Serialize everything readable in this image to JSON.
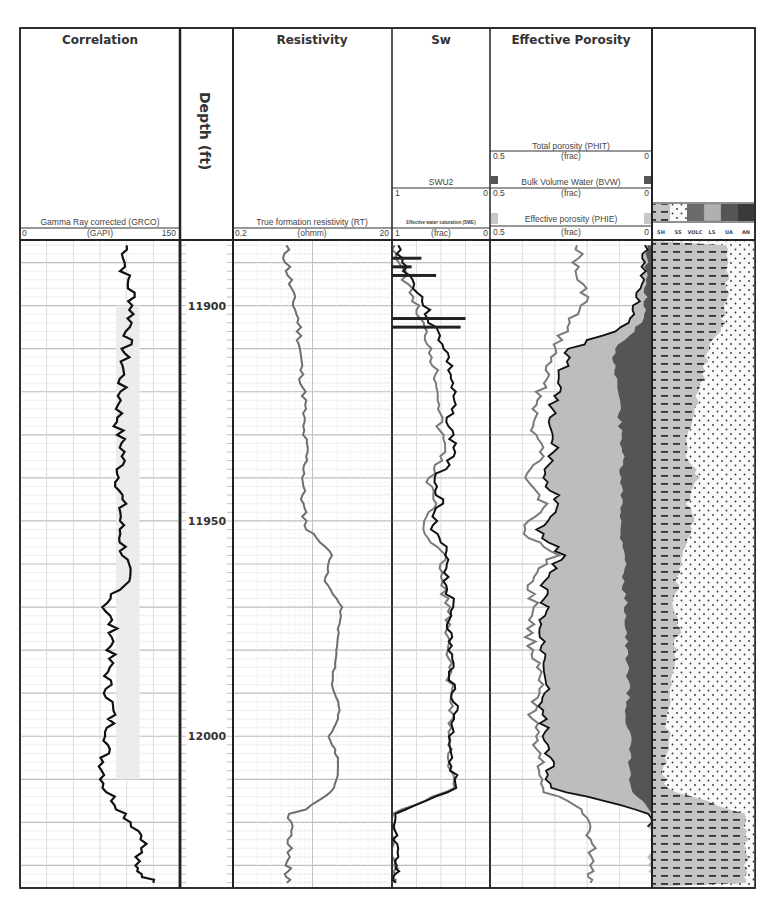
{
  "tracks": {
    "correlation": {
      "title": "Correlation",
      "curve": {
        "name": "Gamma Ray corrected (GRCO)",
        "unit": "(GAPI)",
        "min": "0",
        "max": "150"
      }
    },
    "depth": {
      "title": "Depth (ft)",
      "labels": [
        "11900",
        "11950",
        "12000"
      ]
    },
    "resistivity": {
      "title": "Resistivity",
      "curve": {
        "name": "True formation resistivity (RT)",
        "unit": "(ohmm)",
        "min": "0.2",
        "max": "20"
      }
    },
    "sw": {
      "title": "Sw",
      "curves": [
        {
          "name": "SWU2",
          "unit": "",
          "min": "1",
          "max": "0"
        },
        {
          "name": "Effective water saturation (SWE)",
          "unit": "(frac)",
          "min": "1",
          "max": "0"
        }
      ]
    },
    "porosity": {
      "title": "Effective Porosity",
      "curves": [
        {
          "name": "Total porosity (PHIT)",
          "unit": "(frac)",
          "min": "0.5",
          "max": "0"
        },
        {
          "name": "Bulk Volume Water (BVW)",
          "unit": "(frac)",
          "min": "0.5",
          "max": "0"
        },
        {
          "name": "Effective porosity (PHIE)",
          "unit": "(frac)",
          "min": "0.5",
          "max": "0"
        }
      ]
    },
    "lithology": {
      "legend": [
        "SH",
        "SS",
        "VOLC",
        "LS",
        "UA",
        "AN"
      ]
    }
  },
  "colors": {
    "grid": "#c8c8c8",
    "gr": "#111111",
    "rt": "#6e6e6e",
    "phie_fill": "#bdbdbd",
    "bvw_fill": "#555555",
    "shale": "#c4c4c4",
    "gr_fill": "#ececec"
  },
  "chart_data": {
    "type": "line",
    "ylabel": "Depth (ft)",
    "ylim": [
      11885,
      12035
    ],
    "depth_ticks": [
      11900,
      11950,
      12000
    ],
    "depth": [
      11886,
      11892,
      11898,
      11904,
      11910,
      11916,
      11922,
      11928,
      11934,
      11940,
      11946,
      11952,
      11958,
      11964,
      11970,
      11976,
      11982,
      11988,
      11994,
      12000,
      12006,
      12012,
      12018,
      12024,
      12030,
      12034
    ],
    "series": [
      {
        "name": "GRCO",
        "unit": "GAPI",
        "xlim": [
          0,
          150
        ],
        "values": [
          100,
          98,
          106,
          104,
          99,
          96,
          94,
          92,
          97,
          93,
          95,
          94,
          98,
          100,
          80,
          88,
          84,
          82,
          86,
          84,
          78,
          80,
          98,
          118,
          106,
          125
        ]
      },
      {
        "name": "RT",
        "unit": "ohmm",
        "xlim": [
          0.2,
          20
        ],
        "scale": "log",
        "values": [
          0.9,
          1.0,
          1.1,
          1.35,
          1.4,
          1.45,
          1.6,
          1.5,
          1.7,
          1.55,
          1.5,
          1.7,
          3.5,
          2.8,
          4.6,
          4.2,
          3.9,
          3.5,
          4.5,
          3.2,
          4.3,
          3.8,
          1.1,
          1.0,
          1.0,
          0.95
        ]
      },
      {
        "name": "SWE",
        "unit": "frac",
        "xlim": [
          1,
          0
        ],
        "values": [
          0.95,
          0.85,
          0.7,
          0.6,
          0.45,
          0.4,
          0.38,
          0.42,
          0.35,
          0.55,
          0.5,
          0.6,
          0.42,
          0.45,
          0.38,
          0.42,
          0.4,
          0.38,
          0.35,
          0.4,
          0.38,
          0.36,
          1.0,
          0.98,
          0.97,
          0.96
        ]
      },
      {
        "name": "SWU2",
        "unit": "frac",
        "xlim": [
          1,
          0
        ],
        "values": [
          0.98,
          0.9,
          0.78,
          0.7,
          0.6,
          0.55,
          0.5,
          0.52,
          0.45,
          0.62,
          0.58,
          0.68,
          0.48,
          0.5,
          0.42,
          0.45,
          0.43,
          0.41,
          0.38,
          0.42,
          0.4,
          0.38,
          1.0,
          0.99,
          0.98,
          0.97
        ]
      },
      {
        "name": "PHIT",
        "unit": "frac",
        "xlim": [
          0.5,
          0
        ],
        "values": [
          0.22,
          0.24,
          0.2,
          0.26,
          0.3,
          0.33,
          0.35,
          0.37,
          0.34,
          0.38,
          0.33,
          0.4,
          0.3,
          0.38,
          0.36,
          0.38,
          0.36,
          0.35,
          0.37,
          0.36,
          0.34,
          0.35,
          0.2,
          0.19,
          0.18,
          0.19
        ]
      },
      {
        "name": "PHIE",
        "unit": "frac",
        "xlim": [
          0.5,
          0
        ],
        "values": [
          0.02,
          0.03,
          0.04,
          0.06,
          0.25,
          0.28,
          0.3,
          0.32,
          0.3,
          0.34,
          0.28,
          0.36,
          0.27,
          0.34,
          0.33,
          0.35,
          0.33,
          0.32,
          0.34,
          0.33,
          0.31,
          0.32,
          0.0,
          0.0,
          0.0,
          0.0
        ]
      },
      {
        "name": "BVW",
        "unit": "frac",
        "xlim": [
          0.5,
          0
        ],
        "values": [
          0.01,
          0.02,
          0.02,
          0.03,
          0.12,
          0.11,
          0.1,
          0.1,
          0.09,
          0.1,
          0.09,
          0.1,
          0.08,
          0.09,
          0.08,
          0.08,
          0.08,
          0.07,
          0.08,
          0.07,
          0.07,
          0.07,
          0.0,
          0.0,
          0.0,
          0.0
        ]
      },
      {
        "name": "Shale fraction (lithology)",
        "unit": "frac",
        "xlim": [
          0,
          1
        ],
        "values": [
          0.75,
          0.72,
          0.72,
          0.68,
          0.55,
          0.5,
          0.42,
          0.35,
          0.32,
          0.45,
          0.35,
          0.4,
          0.3,
          0.25,
          0.2,
          0.25,
          0.2,
          0.18,
          0.15,
          0.15,
          0.12,
          0.12,
          0.9,
          0.92,
          0.9,
          0.92
        ]
      }
    ]
  }
}
